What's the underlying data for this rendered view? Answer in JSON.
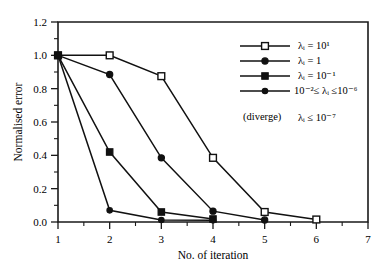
{
  "chart_data": {
    "type": "line",
    "title": "",
    "xlabel": "No. of  iteration",
    "ylabel": "Normalised error",
    "xlim": [
      1,
      7
    ],
    "ylim": [
      0.0,
      1.2
    ],
    "xticks": [
      "1",
      "2",
      "3",
      "4",
      "5",
      "6",
      "7"
    ],
    "yticks": [
      "0.0",
      "0.2",
      "0.4",
      "0.6",
      "0.8",
      "1.0",
      "1.2"
    ],
    "grid": false,
    "legend_position": "upper right",
    "series": [
      {
        "name": "lambda_i = 10^1",
        "marker": "open-square",
        "x": [
          1,
          2,
          3,
          4,
          5,
          6
        ],
        "values": [
          1.0,
          1.0,
          0.875,
          0.385,
          0.06,
          0.015
        ]
      },
      {
        "name": "lambda_i = 1",
        "marker": "filled-circle",
        "x": [
          1,
          2,
          3,
          4,
          5
        ],
        "values": [
          1.0,
          0.885,
          0.385,
          0.065,
          0.012
        ]
      },
      {
        "name": "lambda_i = 10^-1",
        "marker": "filled-square",
        "x": [
          1,
          2,
          3,
          4
        ],
        "values": [
          1.0,
          0.42,
          0.06,
          0.018
        ]
      },
      {
        "name": "10^-2 <= lambda_i <= 10^-6",
        "marker": "filled-circle-small",
        "x": [
          1,
          2,
          3,
          4
        ],
        "values": [
          1.0,
          0.07,
          0.012,
          0.01
        ]
      }
    ],
    "legend_entries": [
      {
        "base": "λ",
        "sub": "i",
        "rel": " = 10",
        "sup": "1",
        "marker": "open-square"
      },
      {
        "base": "λ",
        "sub": "i",
        "rel": " = 1",
        "sup": "",
        "marker": "filled-circle"
      },
      {
        "base": "λ",
        "sub": "i",
        "rel": " = 10",
        "sup": "-1",
        "marker": "filled-square"
      },
      {
        "base": "10",
        "sub": "",
        "rel": "",
        "sup": "-2",
        "marker": "filled-circle-small"
      }
    ],
    "annotations": [
      {
        "text": "(diverge)",
        "kind": "note"
      }
    ]
  },
  "legend": {
    "entry_1_html": "λᵢ = 10¹",
    "entry_2_html": "λᵢ = 1",
    "entry_3_html": "λᵢ = 10⁻¹",
    "entry_4_html": "10⁻²≤ λᵢ ≤10⁻⁶",
    "diverge_note": "(diverge)",
    "diverge_value": "λᵢ ≤ 10⁻⁷"
  },
  "axes": {
    "ylabel": "Normalised error",
    "xlabel": "No. of  iteration",
    "y_tick_0": "0.0",
    "y_tick_1": "0.2",
    "y_tick_2": "0.4",
    "y_tick_3": "0.6",
    "y_tick_4": "0.8",
    "y_tick_5": "1.0",
    "y_tick_6": "1.2",
    "x_tick_0": "1",
    "x_tick_1": "2",
    "x_tick_2": "3",
    "x_tick_3": "4",
    "x_tick_4": "5",
    "x_tick_5": "6",
    "x_tick_6": "7"
  },
  "colors": {
    "ink": "#111111",
    "background": "#ffffff"
  }
}
